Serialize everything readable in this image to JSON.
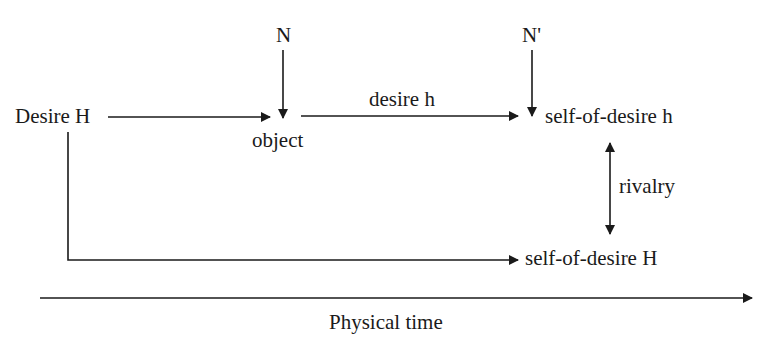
{
  "diagram": {
    "nodes": {
      "desire_H": "Desire H",
      "N": "N",
      "object": "object",
      "N_prime": "N'",
      "self_of_desire_h": "self-of-desire h",
      "self_of_desire_H": "self-of-desire H"
    },
    "edges": {
      "desire_h_label": "desire h",
      "rivalry_label": "rivalry"
    },
    "axis": {
      "label": "Physical time"
    },
    "colors": {
      "ink": "#1a1a1a",
      "background": "#ffffff"
    }
  }
}
